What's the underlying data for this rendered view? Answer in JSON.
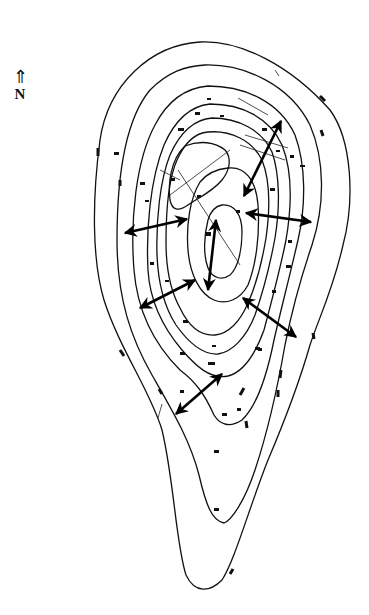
{
  "compass": {
    "arrow_glyph": "⇑",
    "label": "N"
  },
  "map": {
    "type": "topographic contour map",
    "contour_count": 9,
    "stroke_color": "#111111",
    "background": "#ffffff",
    "double_arrows": [
      {
        "name": "ne-arrow",
        "from": [
          213,
          165
        ],
        "to": [
          280,
          120
        ]
      },
      {
        "name": "west-arrow",
        "from": [
          125,
          233
        ],
        "to": [
          188,
          218
        ]
      },
      {
        "name": "east-arrow",
        "from": [
          245,
          213
        ],
        "to": [
          312,
          222
        ]
      },
      {
        "name": "center-arrow",
        "from": [
          215,
          228
        ],
        "to": [
          205,
          290
        ]
      },
      {
        "name": "sw-arrow",
        "from": [
          140,
          306
        ],
        "to": [
          195,
          280
        ]
      },
      {
        "name": "se-arrow",
        "from": [
          243,
          300
        ],
        "to": [
          296,
          336
        ]
      },
      {
        "name": "south-arrow",
        "from": [
          176,
          414
        ],
        "to": [
          222,
          374
        ]
      }
    ]
  }
}
